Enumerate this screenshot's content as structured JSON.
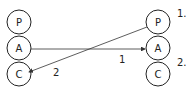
{
  "left_stack": {
    "nodes": [
      "P",
      "A",
      "C"
    ]
  },
  "right_stack": {
    "nodes": [
      "P",
      "A",
      "C"
    ]
  },
  "arrows": [
    {
      "label": "1",
      "from": "left.A",
      "to": "right.A"
    },
    {
      "label": "2",
      "from": "right.P",
      "to": "left.C"
    }
  ],
  "side_labels": [
    "1.",
    "2."
  ]
}
